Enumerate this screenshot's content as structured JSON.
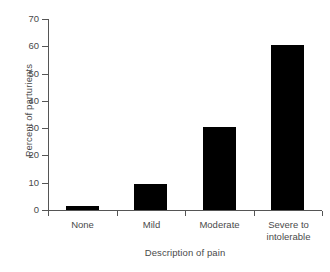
{
  "chart_data": {
    "type": "bar",
    "title": "",
    "subtitle": "",
    "xlabel": "Description of pain",
    "ylabel": "Percent of parturients",
    "categories": [
      "None",
      "Mild",
      "Moderate",
      "Severe to intolerable"
    ],
    "category_lines": [
      [
        "None"
      ],
      [
        "Mild"
      ],
      [
        "Moderate"
      ],
      [
        "Severe to",
        "intolerable"
      ]
    ],
    "values": [
      1.5,
      9.4,
      30.4,
      60.3
    ],
    "ylim": [
      0,
      70
    ],
    "yticks": [
      0,
      10,
      20,
      30,
      40,
      50,
      60,
      70
    ],
    "ytick_labels": [
      "0",
      "10",
      "20",
      "30",
      "40",
      "50",
      "60",
      "70"
    ],
    "grid": false,
    "legend": false,
    "legend_position": "none",
    "bar_color": "#000000",
    "axis_color": "#555555",
    "text_color": "#4a4a4a",
    "background_color": "#ffffff"
  }
}
